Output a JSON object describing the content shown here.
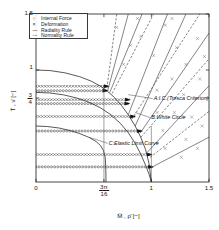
{
  "chart_data": {
    "type": "line",
    "title": "",
    "xlabel": "M̄ , ρ̄  [−]",
    "ylabel": "T̄ , ν̄  [−]",
    "xlim": [
      0,
      1.5
    ],
    "ylim": [
      0,
      1.5
    ],
    "grid": false,
    "xticks": [
      {
        "value": 0,
        "label": "0"
      },
      {
        "value": 0.589,
        "label": "3π/16",
        "numerator": "3π",
        "denominator": "16"
      },
      {
        "value": 1.0,
        "label": "1"
      },
      {
        "value": 1.5,
        "label": "1.5"
      }
    ],
    "yticks": [
      {
        "value": 0.75,
        "label": "3/4",
        "numerator": "3",
        "denominator": "4"
      },
      {
        "value": 1.0,
        "label": "1"
      },
      {
        "value": 1.5,
        "label": "1.5"
      }
    ],
    "legend": {
      "position": "upper-left",
      "entries": [
        {
          "symbol": "○",
          "label": "Internal Force",
          "kind": "marker-circle"
        },
        {
          "symbol": "×",
          "label": "Deformation",
          "kind": "marker-cross"
        },
        {
          "symbol": "—",
          "label": "Radiality Rule",
          "kind": "line-solid"
        },
        {
          "symbol": "---",
          "label": "Normality Rule",
          "kind": "line-dashed"
        }
      ]
    },
    "annotations": [
      {
        "id": "A",
        "text": "A:I.C.(Tresca Criterion)",
        "x": 1.02,
        "y": 0.745,
        "leader_to": [
          0.8,
          0.78
        ]
      },
      {
        "id": "B",
        "text": "B:White Circle",
        "x": 1.0,
        "y": 0.575,
        "leader_to": [
          0.86,
          0.62
        ]
      },
      {
        "id": "C",
        "text": "C:Elastic Limit Curve",
        "x": 0.63,
        "y": 0.345,
        "leader_to": [
          0.46,
          0.4
        ]
      }
    ],
    "series": [
      {
        "name": "A: Tresca interaction curve",
        "kind": "yield-curve",
        "style": "solid",
        "points": [
          [
            0,
            1.0
          ],
          [
            0.12,
            0.995
          ],
          [
            0.25,
            0.975
          ],
          [
            0.38,
            0.94
          ],
          [
            0.48,
            0.9
          ],
          [
            0.56,
            0.855
          ],
          [
            0.62,
            0.81
          ],
          [
            0.68,
            0.755
          ],
          [
            0.74,
            0.685
          ],
          [
            0.8,
            0.6
          ],
          [
            0.86,
            0.5
          ],
          [
            0.91,
            0.395
          ],
          [
            0.95,
            0.29
          ],
          [
            0.98,
            0.165
          ],
          [
            1.0,
            0.0
          ]
        ]
      },
      {
        "name": "B: White Circle",
        "kind": "yield-curve",
        "style": "solid",
        "points": [
          [
            0,
            0.8
          ],
          [
            0.12,
            0.795
          ],
          [
            0.24,
            0.778
          ],
          [
            0.36,
            0.748
          ],
          [
            0.46,
            0.712
          ],
          [
            0.56,
            0.662
          ],
          [
            0.65,
            0.6
          ],
          [
            0.73,
            0.525
          ],
          [
            0.8,
            0.44
          ],
          [
            0.86,
            0.345
          ],
          [
            0.91,
            0.245
          ],
          [
            0.95,
            0.15
          ],
          [
            0.98,
            0.07
          ],
          [
            1.0,
            0.0
          ]
        ]
      },
      {
        "name": "C: Elastic limit curve",
        "kind": "yield-curve",
        "style": "solid",
        "points": [
          [
            0,
            0.5
          ],
          [
            0.1,
            0.495
          ],
          [
            0.2,
            0.482
          ],
          [
            0.3,
            0.458
          ],
          [
            0.38,
            0.432
          ],
          [
            0.46,
            0.398
          ],
          [
            0.52,
            0.362
          ],
          [
            0.56,
            0.325
          ],
          [
            0.585,
            0.28
          ],
          [
            0.6,
            0.22
          ],
          [
            0.605,
            0.13
          ],
          [
            0.607,
            0.0
          ]
        ]
      },
      {
        "name": "deformation track 1",
        "kind": "marker-track",
        "marker": "cross",
        "y": 0.855,
        "x_start": 0.0,
        "x_end": 0.615
      },
      {
        "name": "internal force track 1",
        "kind": "marker-track",
        "marker": "circle",
        "y": 0.815,
        "x_start": 0.0,
        "x_end": 0.605
      },
      {
        "name": "deformation track 2",
        "kind": "marker-track",
        "marker": "cross",
        "y": 0.735,
        "x_start": 0.0,
        "x_end": 0.8
      },
      {
        "name": "internal force track 2",
        "kind": "marker-track",
        "marker": "circle",
        "y": 0.7,
        "x_start": 0.0,
        "x_end": 0.795
      },
      {
        "name": "deformation track 3",
        "kind": "marker-track",
        "marker": "cross",
        "y": 0.585,
        "x_start": 0.0,
        "x_end": 0.845
      },
      {
        "name": "internal force track 3",
        "kind": "marker-track",
        "marker": "circle",
        "y": 0.455,
        "x_start": 0.0,
        "x_end": 0.905
      },
      {
        "name": "deformation track 4",
        "kind": "marker-track",
        "marker": "cross",
        "y": 0.245,
        "x_start": 0.0,
        "x_end": 0.99
      },
      {
        "name": "internal force track 4",
        "kind": "marker-track",
        "marker": "circle",
        "y": 0.135,
        "x_start": 0.0,
        "x_end": 1.0
      },
      {
        "name": "radiality ray 1",
        "kind": "ray",
        "style": "solid",
        "from": [
          0.62,
          0.81
        ],
        "to": [
          0.8,
          1.5
        ]
      },
      {
        "name": "radiality ray 2",
        "kind": "ray",
        "style": "solid",
        "from": [
          0.64,
          0.8
        ],
        "to": [
          0.92,
          1.5
        ]
      },
      {
        "name": "radiality ray 3",
        "kind": "ray",
        "style": "solid",
        "from": [
          0.8,
          0.6
        ],
        "to": [
          1.14,
          1.5
        ]
      },
      {
        "name": "radiality ray 4",
        "kind": "ray",
        "style": "solid",
        "from": [
          0.86,
          0.5
        ],
        "to": [
          1.3,
          1.5
        ]
      },
      {
        "name": "radiality ray 5",
        "kind": "ray",
        "style": "solid",
        "from": [
          0.905,
          0.44
        ],
        "to": [
          1.5,
          1.33
        ]
      },
      {
        "name": "radiality ray 6",
        "kind": "ray",
        "style": "solid",
        "from": [
          0.96,
          0.26
        ],
        "to": [
          1.5,
          0.86
        ]
      },
      {
        "name": "radiality ray 7",
        "kind": "ray",
        "style": "solid",
        "from": [
          1.0,
          0.13
        ],
        "to": [
          1.5,
          0.4
        ]
      },
      {
        "name": "normality ray 1",
        "kind": "ray",
        "style": "dashed",
        "from": [
          0.615,
          0.84
        ],
        "to": [
          0.7,
          1.5
        ]
      },
      {
        "name": "normality ray 2",
        "kind": "ray",
        "style": "dashed",
        "from": [
          0.66,
          0.79
        ],
        "to": [
          1.02,
          1.5
        ]
      },
      {
        "name": "normality ray 3",
        "kind": "ray",
        "style": "dashed",
        "from": [
          0.83,
          0.56
        ],
        "to": [
          1.42,
          1.5
        ]
      },
      {
        "name": "normality ray 4",
        "kind": "ray",
        "style": "dashed",
        "from": [
          0.91,
          0.4
        ],
        "to": [
          1.5,
          1.1
        ]
      },
      {
        "name": "normality ray 5",
        "kind": "ray",
        "style": "dashed",
        "from": [
          0.99,
          0.22
        ],
        "to": [
          1.5,
          0.63
        ]
      },
      {
        "name": "vertical marker at 3pi/16",
        "kind": "vline",
        "x": 0.589,
        "y_from": 0.0,
        "y_to": 0.86
      },
      {
        "name": "vertical marker at 1",
        "kind": "vline",
        "x": 1.0,
        "y_from": 0.0,
        "y_to": 0.5
      }
    ],
    "scatter_points": {
      "name": "scattered deformation crosses",
      "marker": "cross",
      "points": [
        [
          0.7,
          1.38
        ],
        [
          0.82,
          1.22
        ],
        [
          0.76,
          1.05
        ],
        [
          0.91,
          1.3
        ],
        [
          1.02,
          1.13
        ],
        [
          1.12,
          1.4
        ],
        [
          1.22,
          1.2
        ],
        [
          1.3,
          1.05
        ],
        [
          1.4,
          1.28
        ],
        [
          1.18,
          0.92
        ],
        [
          1.05,
          0.82
        ],
        [
          1.28,
          0.78
        ],
        [
          1.42,
          0.92
        ],
        [
          1.35,
          0.58
        ],
        [
          1.2,
          0.62
        ],
        [
          1.1,
          0.46
        ],
        [
          1.3,
          0.38
        ],
        [
          1.44,
          0.5
        ],
        [
          1.12,
          0.3
        ],
        [
          1.26,
          0.22
        ],
        [
          1.4,
          0.3
        ],
        [
          1.05,
          0.62
        ],
        [
          1.46,
          1.12
        ],
        [
          0.88,
          1.46
        ],
        [
          1.18,
          1.46
        ]
      ]
    },
    "colors": {
      "axis": "#1b1b1b",
      "curve": "#222222",
      "marker": "#2a2a2a",
      "ray": "#333333"
    }
  }
}
